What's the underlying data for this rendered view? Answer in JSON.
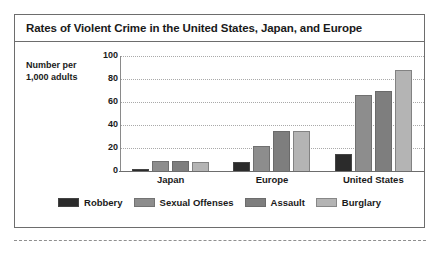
{
  "figure": {
    "title": "Rates of Violent Crime in the United States, Japan, and Europe",
    "axis_caption_line1": "Number per",
    "axis_caption_line2": "1,000 adults"
  },
  "chart_data": {
    "type": "bar",
    "title": "Rates of Violent Crime in the United States, Japan, and Europe",
    "xlabel": "",
    "ylabel": "Number per 1,000 adults",
    "ylim": [
      0,
      100
    ],
    "yticks": [
      0,
      20,
      40,
      60,
      80,
      100
    ],
    "grid": true,
    "legend_position": "bottom",
    "categories": [
      "Japan",
      "Europe",
      "United States"
    ],
    "series": [
      {
        "name": "Robbery",
        "color": "#2b2b2b",
        "values": [
          1,
          8,
          15
        ]
      },
      {
        "name": "Sexual Offenses",
        "color": "#8d8d8d",
        "values": [
          9,
          22,
          66
        ]
      },
      {
        "name": "Assault",
        "color": "#7e7e7e",
        "values": [
          9,
          35,
          70
        ]
      },
      {
        "name": "Burglary",
        "color": "#b4b4b4",
        "values": [
          8,
          35,
          88
        ]
      }
    ]
  }
}
